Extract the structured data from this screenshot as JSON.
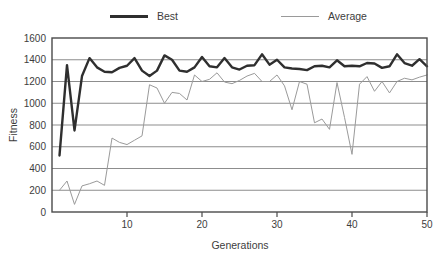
{
  "chart_data": {
    "type": "line",
    "title": "",
    "xlabel": "Generations",
    "ylabel": "Fitness",
    "xlim": [
      0,
      50
    ],
    "ylim": [
      0,
      1600
    ],
    "xticks": [
      10,
      20,
      30,
      40,
      50
    ],
    "yticks": [
      0,
      200,
      400,
      600,
      800,
      1000,
      1200,
      1400,
      1600
    ],
    "grid": "horizontal",
    "legend_position": "top",
    "x": [
      1,
      2,
      3,
      4,
      5,
      6,
      7,
      8,
      9,
      10,
      11,
      12,
      13,
      14,
      15,
      16,
      17,
      18,
      19,
      20,
      21,
      22,
      23,
      24,
      25,
      26,
      27,
      28,
      29,
      30,
      31,
      32,
      33,
      34,
      35,
      36,
      37,
      38,
      39,
      40,
      41,
      42,
      43,
      44,
      45,
      46,
      47,
      48,
      49,
      50
    ],
    "series": [
      {
        "name": "Best",
        "color": "#2f2f2f",
        "width": 2.4,
        "values": [
          520,
          1350,
          750,
          1250,
          1415,
          1330,
          1290,
          1285,
          1325,
          1345,
          1415,
          1300,
          1250,
          1300,
          1440,
          1400,
          1300,
          1290,
          1330,
          1425,
          1340,
          1330,
          1415,
          1330,
          1310,
          1345,
          1350,
          1450,
          1355,
          1400,
          1330,
          1320,
          1315,
          1305,
          1340,
          1345,
          1330,
          1395,
          1340,
          1345,
          1340,
          1370,
          1365,
          1325,
          1340,
          1450,
          1370,
          1345,
          1405,
          1340
        ]
      },
      {
        "name": "Average",
        "color": "#9a9a9a",
        "width": 1.0,
        "values": [
          200,
          285,
          70,
          240,
          260,
          285,
          245,
          680,
          640,
          620,
          660,
          700,
          1170,
          1140,
          1000,
          1100,
          1090,
          1030,
          1260,
          1200,
          1220,
          1280,
          1195,
          1180,
          1210,
          1250,
          1275,
          1200,
          1200,
          1260,
          1160,
          940,
          1200,
          1175,
          820,
          855,
          760,
          1190,
          870,
          530,
          1175,
          1245,
          1110,
          1200,
          1095,
          1200,
          1230,
          1215,
          1240,
          1260
        ]
      }
    ],
    "legend": [
      {
        "label": "Best",
        "color": "#2f2f2f",
        "style": "thick"
      },
      {
        "label": "Average",
        "color": "#9a9a9a",
        "style": "thin"
      }
    ]
  },
  "colors": {
    "best": "#2f2f2f",
    "average": "#9a9a9a",
    "gridline": "#8d8d8d",
    "frame": "#4a4a4a",
    "text": "#3d3d3d",
    "background": "#ffffff"
  }
}
